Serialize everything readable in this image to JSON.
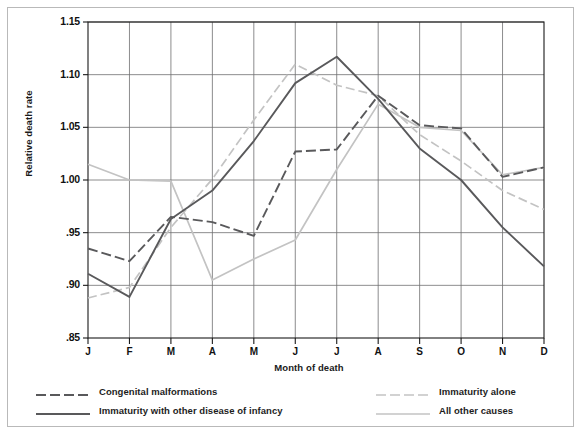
{
  "chart_data": {
    "type": "line",
    "title": "",
    "xlabel": "Month of death",
    "ylabel": "Relative death rate",
    "categories": [
      "J",
      "F",
      "M",
      "A",
      "M",
      "J",
      "J",
      "A",
      "S",
      "O",
      "N",
      "D"
    ],
    "category_names": [
      "January",
      "February",
      "March",
      "April",
      "May",
      "June",
      "July",
      "August",
      "September",
      "October",
      "November",
      "December"
    ],
    "ylim": [
      0.85,
      1.15
    ],
    "yticks": [
      1.15,
      1.1,
      1.05,
      1.0,
      0.95,
      0.9,
      0.85
    ],
    "ytick_labels": [
      "1.15",
      "1.10",
      "1.05",
      "1.00",
      ".95",
      ".90",
      ".85"
    ],
    "grid": true,
    "legend_position": "below-plot",
    "series": [
      {
        "name": "Congenital malformations",
        "style": "dashed",
        "color": "#59595b",
        "values": [
          0.935,
          0.923,
          0.965,
          0.96,
          0.947,
          1.027,
          1.029,
          1.08,
          1.052,
          1.049,
          1.003,
          1.012
        ]
      },
      {
        "name": "Immaturity with other disease of infancy",
        "style": "solid",
        "color": "#59595b",
        "values": [
          0.911,
          0.889,
          0.963,
          0.99,
          1.037,
          1.092,
          1.117,
          1.077,
          1.03,
          1.0,
          0.955,
          0.918
        ]
      },
      {
        "name": "Immaturity alone",
        "style": "dashed",
        "color": "#c3c3c3",
        "values": [
          0.888,
          0.898,
          0.955,
          1.001,
          1.057,
          1.11,
          1.09,
          1.08,
          1.043,
          1.018,
          0.99,
          0.972
        ]
      },
      {
        "name": "All other causes",
        "style": "solid",
        "color": "#c3c3c3",
        "values": [
          1.015,
          1.0,
          0.999,
          0.905,
          0.925,
          0.943,
          1.01,
          1.072,
          1.05,
          1.047,
          1.005,
          1.012
        ]
      }
    ]
  },
  "axes": {
    "ylabel": "Relative death rate",
    "xlabel": "Month of death"
  },
  "legend": {
    "items": [
      {
        "label": "Congenital malformations",
        "style": "dashed",
        "color": "#59595b"
      },
      {
        "label": "Immaturity with other disease of infancy",
        "style": "solid",
        "color": "#59595b"
      },
      {
        "label": "Immaturity alone",
        "style": "dashed",
        "color": "#c3c3c3"
      },
      {
        "label": "All other causes",
        "style": "solid",
        "color": "#c3c3c3"
      }
    ]
  },
  "style": {
    "frame_color": "#b9b9b9",
    "grid_color": "#6e6e70",
    "axis_color": "#1a1a1a",
    "background": "#ffffff"
  }
}
